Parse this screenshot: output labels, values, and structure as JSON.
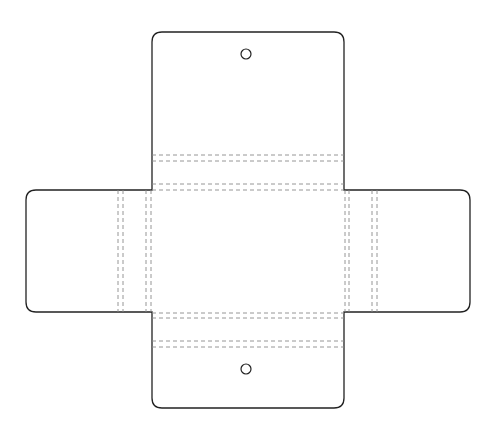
{
  "diagram": {
    "type": "die-cut box template",
    "colors": {
      "background": "#ffffff",
      "cut_line": "#222222",
      "fold_line": "#8a8a8a"
    },
    "panels": {
      "top_flap": {
        "x": 152,
        "y": 32,
        "w": 192,
        "h": 158
      },
      "left_flap": {
        "x": 26,
        "y": 190,
        "w": 126,
        "h": 122
      },
      "right_flap": {
        "x": 344,
        "y": 190,
        "w": 126,
        "h": 122
      },
      "bottom_flap": {
        "x": 152,
        "y": 312,
        "w": 192,
        "h": 96
      }
    },
    "holes": [
      {
        "name": "top-hole",
        "cx": 246,
        "cy": 54,
        "r": 5
      },
      {
        "name": "bottom-hole",
        "cx": 246,
        "cy": 369,
        "r": 5
      }
    ],
    "fold_lines_horizontal_y": [
      155,
      161,
      184,
      190,
      313,
      318,
      341,
      347
    ],
    "fold_lines_vertical_x": [
      118,
      123,
      146,
      151,
      345,
      349,
      372,
      377
    ]
  }
}
